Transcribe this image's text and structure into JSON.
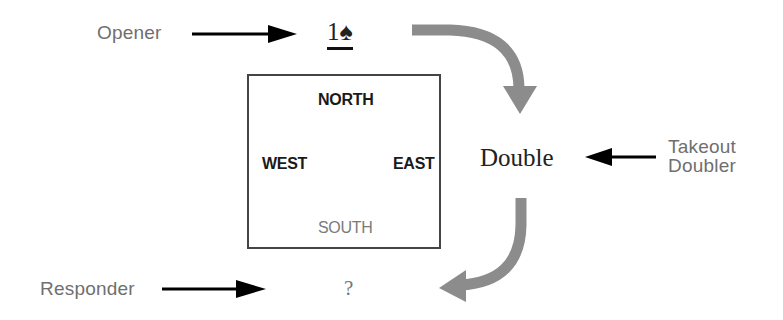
{
  "diagram": {
    "labels": {
      "opener": "Opener",
      "takeout_doubler_line1": "Takeout",
      "takeout_doubler_line2": "Doubler",
      "responder": "Responder"
    },
    "bids": {
      "opening_bid": "1♠",
      "double": "Double",
      "response": "?"
    },
    "table": {
      "north": "NORTH",
      "west": "WEST",
      "east": "EAST",
      "south": "SOUTH"
    },
    "colors": {
      "flow_arrow": "#8c8c8c",
      "pointer_arrow": "#000000",
      "label_text": "#6f6f6f",
      "box_border": "#444444"
    }
  }
}
